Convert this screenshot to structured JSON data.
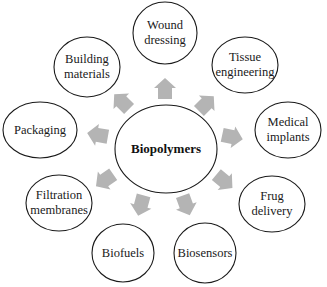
{
  "diagram": {
    "type": "radial-mind-map",
    "center": {
      "label": "Biopolymers",
      "cx": 166,
      "cy": 149,
      "rx": 51,
      "ry": 44
    },
    "nodes": [
      {
        "id": "wound-dressing",
        "lines": [
          "Wound",
          "dressing"
        ],
        "cx": 165,
        "cy": 33,
        "rx": 32,
        "ry": 31
      },
      {
        "id": "tissue-engineering",
        "lines": [
          "Tissue",
          "engineering"
        ],
        "cx": 245,
        "cy": 65,
        "rx": 33,
        "ry": 28
      },
      {
        "id": "medical-implants",
        "lines": [
          "Medical",
          "implants"
        ],
        "cx": 288,
        "cy": 130,
        "rx": 33,
        "ry": 28
      },
      {
        "id": "frug-delivery",
        "lines": [
          "Frug",
          "delivery"
        ],
        "cx": 272,
        "cy": 204,
        "rx": 33,
        "ry": 28
      },
      {
        "id": "biosensors",
        "lines": [
          "Biosensors"
        ],
        "cx": 205,
        "cy": 253,
        "rx": 31,
        "ry": 30
      },
      {
        "id": "biofuels",
        "lines": [
          "Biofuels"
        ],
        "cx": 123,
        "cy": 253,
        "rx": 31,
        "ry": 29
      },
      {
        "id": "filtration-membranes",
        "lines": [
          "Filtration",
          "membranes"
        ],
        "cx": 59,
        "cy": 203,
        "rx": 33,
        "ry": 28
      },
      {
        "id": "packaging",
        "lines": [
          "Packaging"
        ],
        "cx": 40,
        "cy": 130,
        "rx": 37,
        "ry": 28
      },
      {
        "id": "building-materials",
        "lines": [
          "Building",
          "materials"
        ],
        "cx": 87,
        "cy": 67,
        "rx": 33,
        "ry": 30
      }
    ],
    "arrows": [
      {
        "target": "wound-dressing",
        "x": 165,
        "y": 89,
        "angle": -90
      },
      {
        "target": "tissue-engineering",
        "x": 206,
        "y": 104,
        "angle": -45
      },
      {
        "target": "medical-implants",
        "x": 232,
        "y": 137,
        "angle": 12
      },
      {
        "target": "frug-delivery",
        "x": 224,
        "y": 181,
        "angle": 40
      },
      {
        "target": "biosensors",
        "x": 186,
        "y": 205,
        "angle": 70
      },
      {
        "target": "biofuels",
        "x": 141,
        "y": 205,
        "angle": 105
      },
      {
        "target": "filtration-membranes",
        "x": 105,
        "y": 180,
        "angle": 145
      },
      {
        "target": "packaging",
        "x": 98,
        "y": 135,
        "angle": 190
      },
      {
        "target": "building-materials",
        "x": 122,
        "y": 102,
        "angle": 225
      }
    ],
    "colors": {
      "ellipse_stroke": "#1a1a1a",
      "arrow_fill": "#b4b4b4",
      "text": "#1a1a1a",
      "background": "#ffffff"
    }
  }
}
